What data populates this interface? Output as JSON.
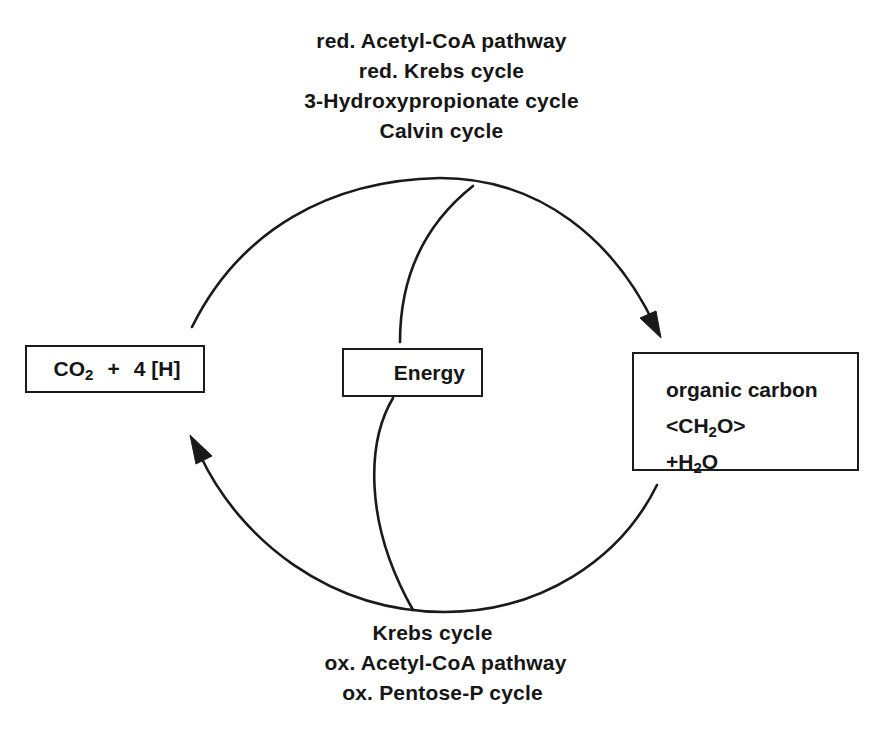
{
  "diagram": {
    "top_labels": [
      "red. Acetyl-CoA pathway",
      "red. Krebs cycle",
      "3-Hydroxypropionate cycle",
      "Calvin cycle"
    ],
    "bottom_labels": [
      "Krebs cycle",
      "ox. Acetyl-CoA pathway",
      "ox. Pentose-P cycle"
    ],
    "nodes": {
      "co2": {
        "prefix": "CO",
        "subscript": "2",
        "suffix_plus": "+",
        "suffix": "4 [H]"
      },
      "energy": {
        "label": "Energy"
      },
      "organic_carbon": {
        "line1": "organic carbon",
        "line2_prefix": "<CH",
        "line2_subscript": "2",
        "line2_suffix": "O>",
        "line3_prefix": "+H",
        "line3_subscript": "2",
        "line3_suffix": "O"
      }
    },
    "edges": [
      {
        "from": "co2",
        "to": "organic_carbon",
        "via": "top_labels",
        "direction": "clockwise-top",
        "energy_link": "Energy box feeds top arc"
      },
      {
        "from": "organic_carbon",
        "to": "co2",
        "via": "bottom_labels",
        "direction": "clockwise-bottom",
        "energy_link": "bottom arc releases to Energy box"
      }
    ],
    "colors": {
      "ink": "#1a1a1a",
      "background": "#ffffff"
    }
  }
}
